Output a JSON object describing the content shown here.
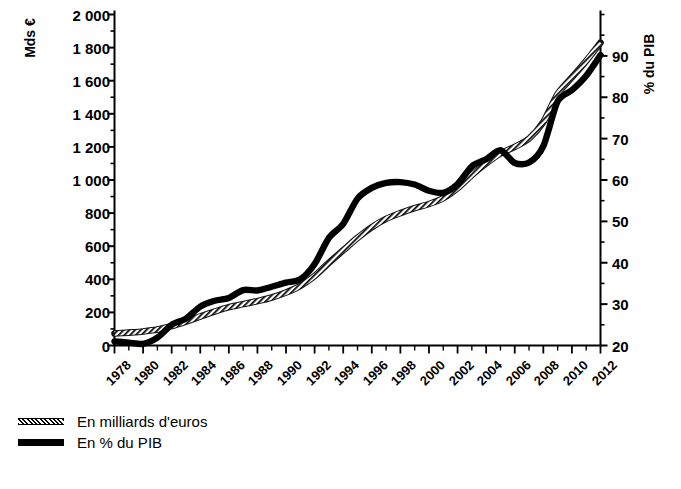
{
  "chart_data": {
    "type": "line",
    "title": "",
    "subtitle": "",
    "xlabel": "",
    "ylabel": "Mds €",
    "ylabel_right": "% du PIB",
    "grid": false,
    "legend_position": "bottom-left",
    "x": [
      1978,
      1979,
      1980,
      1981,
      1982,
      1983,
      1984,
      1985,
      1986,
      1987,
      1988,
      1989,
      1990,
      1991,
      1992,
      1993,
      1994,
      1995,
      1996,
      1997,
      1998,
      1999,
      2000,
      2001,
      2002,
      2003,
      2004,
      2005,
      2006,
      2007,
      2008,
      2009,
      2010,
      2011,
      2012
    ],
    "xtick_labels": [
      "1978",
      "1980",
      "1982",
      "1984",
      "1986",
      "1988",
      "1990",
      "1992",
      "1994",
      "1996",
      "1998",
      "2000",
      "2002",
      "2004",
      "2006",
      "2008",
      "2010",
      "2012"
    ],
    "xlim": [
      1978,
      2012
    ],
    "ylim": [
      0,
      2000
    ],
    "ytick_labels": [
      "0",
      "200",
      "400",
      "600",
      "800",
      "1 000",
      "1 200",
      "1 400",
      "1 600",
      "1 800",
      "2 000"
    ],
    "ytick_values": [
      0,
      200,
      400,
      600,
      800,
      1000,
      1200,
      1400,
      1600,
      1800,
      2000
    ],
    "ytick_minor_step": 100,
    "ylim_right": [
      20,
      100
    ],
    "ytick_labels_right": [
      "20",
      "30",
      "40",
      "50",
      "60",
      "70",
      "80",
      "90"
    ],
    "ytick_values_right": [
      20,
      30,
      40,
      50,
      60,
      70,
      80,
      90
    ],
    "ytick_minor_step_right": 5,
    "series": [
      {
        "name": "En milliards d'euros",
        "axis": "left",
        "style": "hatched",
        "values": [
          72,
          78,
          85,
          96,
          118,
          145,
          175,
          205,
          232,
          250,
          268,
          290,
          320,
          360,
          420,
          500,
          575,
          650,
          715,
          765,
          800,
          830,
          855,
          890,
          950,
          1030,
          1100,
          1160,
          1200,
          1250,
          1350,
          1520,
          1620,
          1720,
          1830
        ]
      },
      {
        "name": "En % du PIB",
        "axis": "right",
        "style": "solid",
        "values": [
          21.0,
          20.7,
          20.4,
          21.9,
          25.0,
          26.5,
          29.4,
          30.8,
          31.5,
          33.4,
          33.3,
          34.2,
          35.2,
          36.0,
          39.7,
          46.0,
          49.4,
          55.5,
          58.1,
          59.3,
          59.5,
          58.9,
          57.4,
          56.9,
          59.0,
          63.3,
          65.0,
          67.2,
          64.1,
          64.2,
          68.2,
          79.0,
          81.7,
          85.2,
          90.2
        ]
      }
    ]
  },
  "axis_titles": {
    "left": "Mds €",
    "right": "% du PIB"
  },
  "legend": {
    "items": [
      {
        "label": "En milliards d'euros",
        "style": "hatched"
      },
      {
        "label": "En % du PIB",
        "style": "solid"
      }
    ]
  },
  "colors": {
    "ink": "#000000",
    "background": "#ffffff"
  }
}
